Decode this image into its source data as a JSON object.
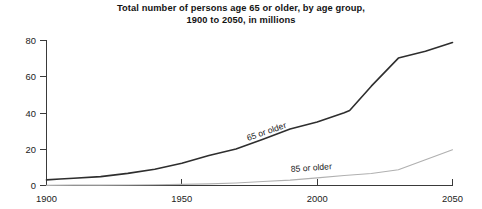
{
  "chart_data": {
    "type": "line",
    "title": "Total number of persons age 65 or older, by age group, 1900 to 2050, in millions",
    "title_line1": "Total number of persons age 65 or older, by age group,",
    "title_line2": "1900 to 2050, in millions",
    "xlabel": "",
    "ylabel": "",
    "xlim": [
      1900,
      2050
    ],
    "ylim": [
      0,
      80
    ],
    "xticks": [
      1900,
      1950,
      2000,
      2050
    ],
    "yticks": [
      0,
      20,
      40,
      60,
      80
    ],
    "xtick_labels": [
      "1900",
      "1950",
      "2000",
      "2050"
    ],
    "ytick_labels": [
      "0",
      "20",
      "40",
      "60",
      "80"
    ],
    "grid": false,
    "legend_position": "inline-on-series",
    "units": "millions of persons",
    "series": [
      {
        "name": "65 or older",
        "label": "65 or older",
        "color": "#2e2e2e",
        "label_rotation_deg": -19,
        "x": [
          1900,
          1905,
          1910,
          1920,
          1930,
          1940,
          1950,
          1960,
          1970,
          1980,
          1990,
          2000,
          2010,
          2012,
          2020,
          2030,
          2040,
          2050
        ],
        "values": [
          3.1,
          3.6,
          4.0,
          4.9,
          6.7,
          9.0,
          12.3,
          16.6,
          20.1,
          25.5,
          31.2,
          35.0,
          40.2,
          41.4,
          54.8,
          70.3,
          74.1,
          78.9
        ]
      },
      {
        "name": "85 or older",
        "label": "85 or older",
        "color": "#b0b0b0",
        "label_rotation_deg": -4,
        "x": [
          1900,
          1910,
          1920,
          1930,
          1940,
          1950,
          1960,
          1970,
          1980,
          1990,
          2000,
          2010,
          2020,
          2030,
          2040,
          2050
        ],
        "values": [
          0.1,
          0.2,
          0.2,
          0.3,
          0.4,
          0.6,
          0.9,
          1.4,
          2.2,
          3.0,
          4.2,
          5.5,
          6.6,
          8.7,
          14.2,
          19.7
        ]
      }
    ]
  },
  "axis": {
    "y_tick_0": "0",
    "y_tick_1": "20",
    "y_tick_2": "40",
    "y_tick_3": "60",
    "y_tick_4": "80",
    "x_tick_0": "1900",
    "x_tick_1": "1950",
    "x_tick_2": "2000",
    "x_tick_3": "2050"
  },
  "series_labels": {
    "older65": "65 or older",
    "older85": "85 or older"
  }
}
